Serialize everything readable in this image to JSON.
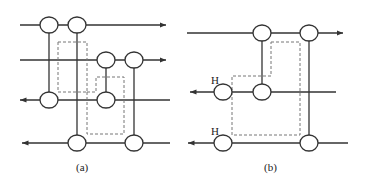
{
  "diagrams": [
    {
      "id": "a",
      "caption": "(a)",
      "lines": [
        {
          "y": 25,
          "x1": 20,
          "x2": 166,
          "direction": "right"
        },
        {
          "y": 60,
          "x1": 20,
          "x2": 166,
          "direction": "right"
        },
        {
          "y": 100,
          "x1": 20,
          "x2": 170,
          "direction": "left"
        },
        {
          "y": 143,
          "x1": 22,
          "x2": 170,
          "direction": "left"
        }
      ],
      "nodes": [
        {
          "x": 49,
          "y": 25
        },
        {
          "x": 77,
          "y": 25
        },
        {
          "x": 106,
          "y": 60
        },
        {
          "x": 134,
          "y": 60
        },
        {
          "x": 49,
          "y": 100
        },
        {
          "x": 106,
          "y": 100
        },
        {
          "x": 77,
          "y": 143
        },
        {
          "x": 134,
          "y": 143
        }
      ],
      "verticals": [
        {
          "x": 49,
          "y1": 25,
          "y2": 100
        },
        {
          "x": 77,
          "y1": 25,
          "y2": 143
        },
        {
          "x": 106,
          "y1": 60,
          "y2": 100
        },
        {
          "x": 134,
          "y1": 60,
          "y2": 143
        }
      ]
    },
    {
      "id": "b",
      "caption": "(b)",
      "node_label": "H",
      "lines": [
        {
          "y": 33,
          "x1": 187,
          "x2": 343,
          "direction": "right"
        },
        {
          "y": 92,
          "x1": 190,
          "x2": 336,
          "direction": "left"
        },
        {
          "y": 143,
          "x1": 188,
          "x2": 348,
          "direction": "left"
        }
      ],
      "nodes": [
        {
          "x": 262,
          "y": 33
        },
        {
          "x": 309,
          "y": 33
        },
        {
          "x": 223,
          "y": 92,
          "label": "H"
        },
        {
          "x": 262,
          "y": 92
        },
        {
          "x": 223,
          "y": 143,
          "label": "H"
        },
        {
          "x": 309,
          "y": 143
        }
      ],
      "verticals": [
        {
          "x": 262,
          "y1": 33,
          "y2": 92
        },
        {
          "x": 309,
          "y1": 33,
          "y2": 143
        }
      ]
    }
  ]
}
